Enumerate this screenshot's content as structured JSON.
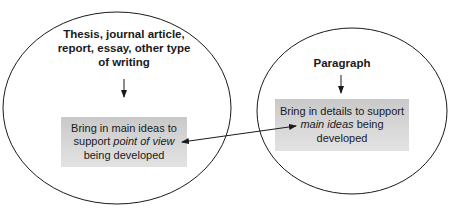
{
  "diagram": {
    "left_circle": {
      "title": "Thesis, journal article, report, essay, other type of writing",
      "title_lines": [
        "Thesis, journal article,",
        "report, essay, other type",
        "of writing"
      ],
      "box": {
        "line1": "Bring in main ideas to",
        "line2_prefix": "support ",
        "line2_emphasis": "point of view",
        "line3": "being developed"
      }
    },
    "right_circle": {
      "title": "Paragraph",
      "box": {
        "line1": "Bring in details to support",
        "line2_emphasis": "main ideas",
        "line2_suffix": " being",
        "line3": "developed"
      }
    },
    "connector": {
      "type": "double-headed-arrow",
      "from": "right-box",
      "to": "left-box"
    },
    "colors": {
      "stroke": "#1a1a1a",
      "box_fill": "#d4d4d4",
      "background": "#ffffff"
    }
  }
}
